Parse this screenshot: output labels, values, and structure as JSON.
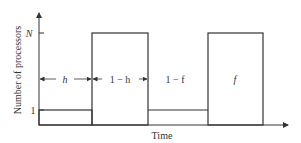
{
  "diagram": {
    "ylabel": "Number of processors",
    "xlabel": "Time",
    "y_ticks": {
      "top": "N",
      "bottom": "1"
    },
    "segments": [
      {
        "label": "h",
        "processors": "1",
        "style": "arrow"
      },
      {
        "label": "1 − h",
        "processors": "N",
        "style": "arrow"
      },
      {
        "label": "1 − f",
        "processors": "1",
        "style": "text"
      },
      {
        "label": "f",
        "processors": "N",
        "style": "text"
      }
    ],
    "colors": {
      "line": "#333333",
      "background": "#ffffff"
    }
  }
}
